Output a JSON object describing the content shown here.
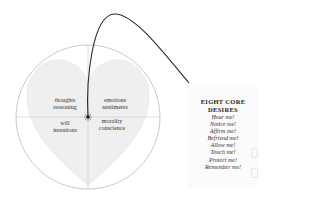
{
  "diagram": {
    "quadrants": {
      "top_left": [
        "thoughts",
        "reasoning"
      ],
      "top_right": [
        "emotions",
        "sentiments"
      ],
      "bottom_left": [
        "will",
        "intentions"
      ],
      "bottom_right": [
        "morality",
        "conscience"
      ]
    },
    "colors": {
      "circle_stroke": "#bdbdbd",
      "heart_fill": "#efefef",
      "axis_stroke": "#c8c8c8",
      "curve_stroke": "#2a2a2a"
    }
  },
  "panel": {
    "title_line1": "EIGHT  CORE",
    "title_line2": "DESIRES",
    "items": [
      "Hear me!",
      "Notice me!",
      "Affirm me!",
      "Befriend me!",
      "Allow me!",
      "Touch me!",
      "Protect me!",
      "Remember me!"
    ]
  }
}
